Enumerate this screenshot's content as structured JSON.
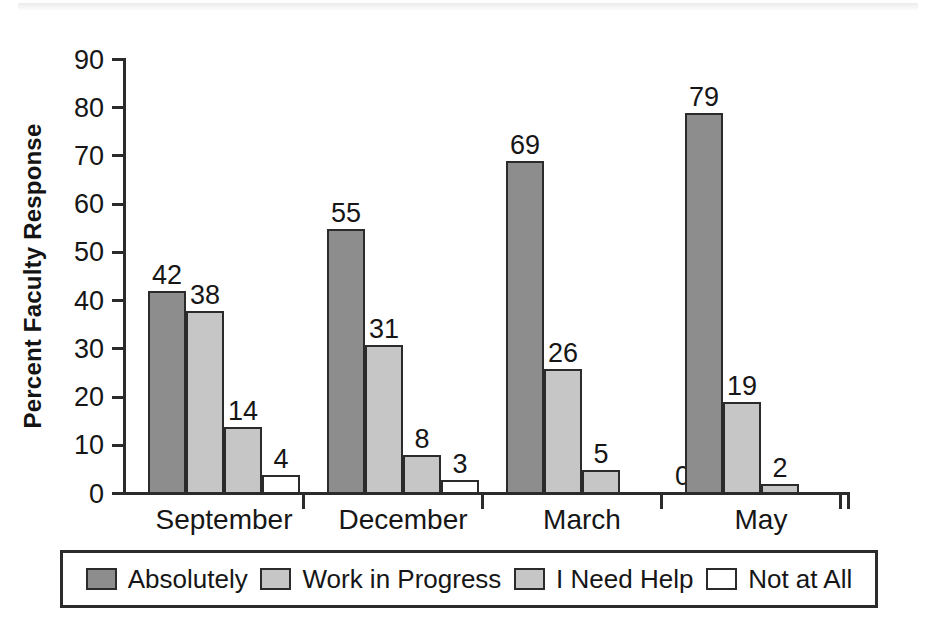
{
  "chart_data": {
    "type": "bar",
    "title": "",
    "subtitle": "",
    "xlabel": "",
    "ylabel": "Percent Faculty Response",
    "categories": [
      "September",
      "December",
      "March",
      "May"
    ],
    "series": [
      {
        "name": "Absolutely",
        "color": "#8d8d8d",
        "values": [
          42,
          55,
          69,
          79
        ]
      },
      {
        "name": "Work in Progress",
        "color": "#c6c6c6",
        "values": [
          38,
          31,
          26,
          19
        ]
      },
      {
        "name": "I Need Help",
        "color": "#c6c6c6",
        "values": [
          14,
          8,
          5,
          2
        ]
      },
      {
        "name": "Not at All",
        "color": "#ffffff",
        "values": [
          4,
          3,
          0,
          null
        ]
      }
    ],
    "value_labels": [
      [
        "42",
        "38",
        "14",
        "4"
      ],
      [
        "55",
        "31",
        "8",
        "3"
      ],
      [
        "69",
        "26",
        "5",
        "0"
      ],
      [
        "79",
        "19",
        "2",
        ""
      ]
    ],
    "ylim": [
      0,
      90
    ],
    "yticks": [
      0,
      10,
      20,
      30,
      40,
      50,
      60,
      70,
      80,
      90
    ],
    "ytick_labels": [
      "0",
      "10",
      "20",
      "30",
      "40",
      "50",
      "60",
      "70",
      "80",
      "90"
    ],
    "grid": false,
    "legend_position": "bottom",
    "axis_color": "#2b2b2b",
    "text_color": "#161616"
  },
  "legend": {
    "items": [
      {
        "label": "Absolutely"
      },
      {
        "label": "Work in Progress"
      },
      {
        "label": "I Need Help"
      },
      {
        "label": "Not at All"
      }
    ]
  }
}
